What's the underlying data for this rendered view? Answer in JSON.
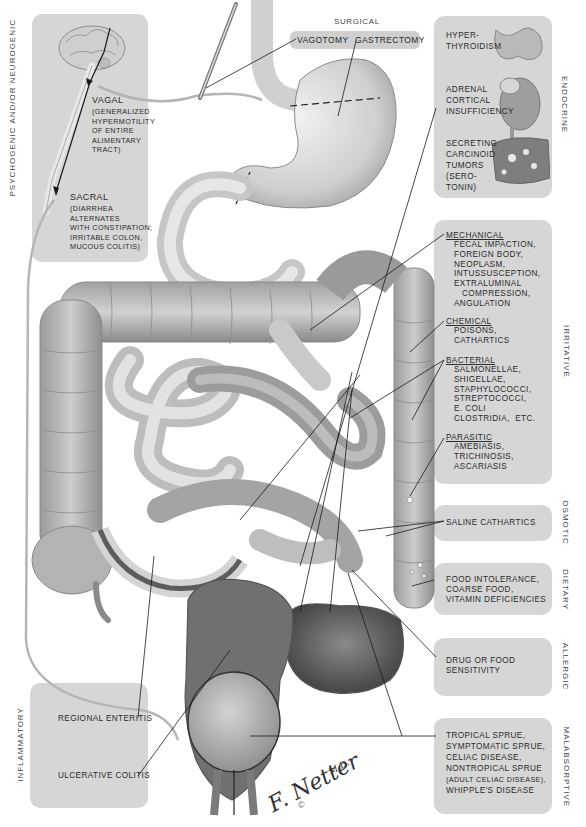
{
  "figure": {
    "signature": "F. Netter",
    "signature_suffix": "M.D.",
    "copyright": "©"
  },
  "categories": {
    "psychogenic": {
      "label": "PSYCHOGENIC AND/OR NEUROGENIC",
      "items": [
        {
          "heading": "VAGAL",
          "text": "(GENERALIZED\nHYPERMOTILITY\nOF ENTIRE\nALIMENTARY\nTRACT)"
        },
        {
          "heading": "SACRAL",
          "text": "(DIARRHEA\nALTERNATES\nWITH CONSTIPATION;\nIRRITABLE COLON,\nMUCOUS COLITIS)"
        }
      ]
    },
    "surgical": {
      "label": "SURGICAL",
      "items": [
        "VAGOTOMY",
        "GASTRECTOMY"
      ]
    },
    "endocrine": {
      "label": "ENDOCRINE",
      "items": [
        {
          "text": "HYPER-\nTHYROIDISM"
        },
        {
          "text": "ADRENAL\nCORTICAL\nINSUFFICIENCY"
        },
        {
          "text": "SECRETING\nCARCINOID\nTUMORS\n(SERO-\nTONIN)"
        }
      ]
    },
    "irritative": {
      "label": "IRRITATIVE",
      "groups": [
        {
          "heading": "MECHANICAL",
          "text": "FECAL IMPACTION,\nFOREIGN BODY,\nNEOPLASM,\nINTUSSUSCEPTION,\nEXTRALUMINAL\n   COMPRESSION,\nANGULATION"
        },
        {
          "heading": "CHEMICAL",
          "text": "POISONS,\nCATHARTICS"
        },
        {
          "heading": "BACTERIAL",
          "text": "SALMONELLAE,\nSHIGELLAE,\nSTAPHYLOCOCCI,\nSTREPTOCOCCI,\nE. COLI\nCLOSTRIDIA,  etc."
        },
        {
          "heading": "PARASITIC",
          "text": "AMEBIASIS,\nTRICHINOSIS,\nASCARIASIS"
        }
      ]
    },
    "osmotic": {
      "label": "OSMOTIC",
      "text": "SALINE CATHARTICS"
    },
    "dietary": {
      "label": "DIETARY",
      "text": "FOOD INTOLERANCE,\nCOARSE FOOD,\nVITAMIN DEFICIENCIES"
    },
    "allergic": {
      "label": "ALLERGIC",
      "text": "DRUG OR FOOD\nSENSITIVITY"
    },
    "malabsorptive": {
      "label": "MALABSORPTIVE",
      "lines": [
        "TROPICAL SPRUE,",
        "SYMPTOMATIC SPRUE,",
        "CELIAC DISEASE,",
        "NONTROPICAL SPRUE"
      ],
      "small_line": "(ADULT CELIAC DISEASE),",
      "last_line": "WHIPPLE'S DISEASE"
    },
    "inflammatory": {
      "label": "INFLAMMATORY",
      "items": [
        "REGIONAL ENTERITIS",
        "ULCERATIVE COLITIS"
      ]
    }
  },
  "colors": {
    "panel": "#d6d6d6",
    "organ_light": "#d9d9d9",
    "organ_mid": "#a9a9a9",
    "organ_dark": "#6a6a6a",
    "leader_line": "#1a1a1a",
    "nerve": "#b5b5b5"
  }
}
